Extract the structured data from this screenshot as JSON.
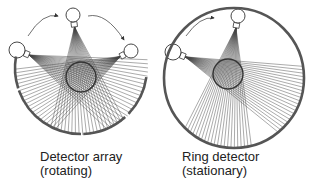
{
  "panels": [
    {
      "id": "detector-array",
      "caption_line1": "Detector array",
      "caption_line2": "(rotating)",
      "object": {
        "cx": 81,
        "cy": 77,
        "r": 15
      },
      "sources": [
        {
          "cx": 73,
          "cy": 15,
          "r": 7,
          "angle": 180
        },
        {
          "cx": 17,
          "cy": 50,
          "r": 8,
          "angle": 110
        },
        {
          "cx": 131,
          "cy": 51,
          "r": 7,
          "angle": 250
        }
      ],
      "detector_arcs": [
        {
          "cx": 81,
          "cy": 68,
          "r": 66,
          "from": 100,
          "to": 180
        },
        {
          "cx": 81,
          "cy": 68,
          "r": 66,
          "from": 40,
          "to": 100
        },
        {
          "cx": 81,
          "cy": 68,
          "r": 66,
          "from": 200,
          "to": 280
        }
      ],
      "rotation_arrows": [
        {
          "from": [
            28,
            36
          ],
          "to": [
            58,
            16
          ]
        },
        {
          "from": [
            88,
            16
          ],
          "to": [
            124,
            40
          ]
        }
      ]
    },
    {
      "id": "ring-detector",
      "caption_line1": "Ring detector",
      "caption_line2": "(stationary)",
      "ring": {
        "cx": 234,
        "cy": 78,
        "r": 70
      },
      "object": {
        "cx": 228,
        "cy": 74,
        "r": 15
      },
      "sources": [
        {
          "cx": 238,
          "cy": 16,
          "r": 7
        },
        {
          "cx": 173,
          "cy": 52,
          "r": 8
        }
      ],
      "rotation_arrows": [
        {
          "from": [
            186,
            36
          ],
          "to": [
            214,
            18
          ]
        }
      ]
    }
  ],
  "colors": {
    "stroke": "#333333",
    "detector": "#555555",
    "rays": "#444444"
  }
}
